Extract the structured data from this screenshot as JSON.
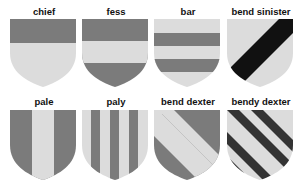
{
  "colors": {
    "dark": "#7b7b7b",
    "light": "#dcdcdc",
    "black": "#111111"
  },
  "shields": [
    {
      "id": "chief",
      "label": "chief"
    },
    {
      "id": "fess",
      "label": "fess"
    },
    {
      "id": "bar",
      "label": "bar"
    },
    {
      "id": "bend-sinister",
      "label": "bend sinister"
    },
    {
      "id": "pale",
      "label": "pale"
    },
    {
      "id": "paly",
      "label": "paly"
    },
    {
      "id": "bend-dexter",
      "label": "bend dexter"
    },
    {
      "id": "bendy-dexter",
      "label": "bendy dexter"
    }
  ]
}
